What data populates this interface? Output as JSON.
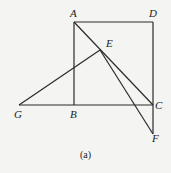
{
  "caption": "(a)",
  "labels": {
    "A": "A",
    "D": "D",
    "E": "E",
    "G": "G",
    "B": "B",
    "C": "C",
    "F": "F"
  },
  "points": {
    "A": [
      74,
      22
    ],
    "D": [
      153,
      22
    ],
    "B": [
      74,
      105
    ],
    "C": [
      153,
      105
    ],
    "G": [
      19,
      105
    ],
    "E": [
      100,
      50
    ],
    "F": [
      153,
      134
    ]
  },
  "segments": [
    [
      "A",
      "D"
    ],
    [
      "D",
      "C"
    ],
    [
      "A",
      "B"
    ],
    [
      "G",
      "C"
    ],
    [
      "A",
      "C"
    ],
    [
      "G",
      "E"
    ],
    [
      "E",
      "F"
    ],
    [
      "C",
      "F"
    ]
  ],
  "colors": {
    "stroke": "#2a2a2a",
    "background": "#f4f4f2"
  }
}
